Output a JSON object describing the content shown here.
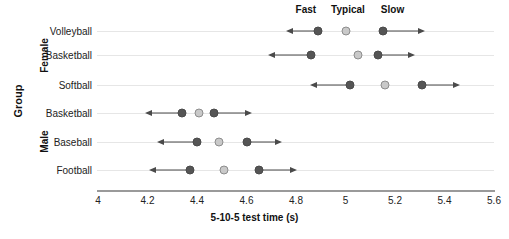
{
  "chart_data": {
    "type": "scatter",
    "title": "",
    "xlabel": "5-10-5 test time (s)",
    "ylabel": "Group",
    "xlim": [
      4,
      5.6
    ],
    "xticks": [
      "4",
      "4.2",
      "4.4",
      "4.6",
      "4.8",
      "5",
      "5.2",
      "5.4",
      "5.6"
    ],
    "xtick_values": [
      4,
      4.2,
      4.4,
      4.6,
      4.8,
      5.0,
      5.2,
      5.4,
      5.6
    ],
    "grid": "horizontal",
    "legend_position": "top",
    "column_headers": [
      "Fast",
      "Typical",
      "Slow"
    ],
    "column_header_x": [
      4.84,
      5.01,
      5.19
    ],
    "group_labels": [
      "Female",
      "Male"
    ],
    "categories": [
      "Volleyball",
      "Basketball",
      "Softball",
      "Basketball",
      "Baseball",
      "Football"
    ],
    "series": [
      {
        "name": "Fast",
        "values": [
          4.89,
          4.86,
          5.02,
          4.34,
          4.4,
          4.37
        ]
      },
      {
        "name": "Typical",
        "values": [
          5.0,
          5.05,
          5.16,
          4.41,
          4.49,
          4.51
        ]
      },
      {
        "name": "Slow",
        "values": [
          5.15,
          5.13,
          5.31,
          4.47,
          4.6,
          4.65
        ]
      }
    ],
    "rows": [
      {
        "group": "Female",
        "label": "Volleyball",
        "fast": 4.89,
        "typical": 5.0,
        "slow": 5.15,
        "fast_arrow_end": 4.77,
        "slow_arrow_end": 5.31
      },
      {
        "group": "Female",
        "label": "Basketball",
        "fast": 4.86,
        "typical": 5.05,
        "slow": 5.13,
        "fast_arrow_end": 4.7,
        "slow_arrow_end": 5.27
      },
      {
        "group": "Female",
        "label": "Softball",
        "fast": 5.02,
        "typical": 5.16,
        "slow": 5.31,
        "fast_arrow_end": 4.87,
        "slow_arrow_end": 5.45
      },
      {
        "group": "Male",
        "label": "Basketball",
        "fast": 4.34,
        "typical": 4.41,
        "slow": 4.47,
        "fast_arrow_end": 4.2,
        "slow_arrow_end": 4.61
      },
      {
        "group": "Male",
        "label": "Baseball",
        "fast": 4.4,
        "typical": 4.49,
        "slow": 4.6,
        "fast_arrow_end": 4.25,
        "slow_arrow_end": 4.73
      },
      {
        "group": "Male",
        "label": "Football",
        "fast": 4.37,
        "typical": 4.51,
        "slow": 4.65,
        "fast_arrow_end": 4.22,
        "slow_arrow_end": 4.79
      }
    ],
    "colors": {
      "fast_dot": "#555555",
      "typical_dot": "#c9c9c9",
      "slow_dot": "#555555",
      "arrow": "#4a4a4a",
      "gridline": "#e6e6e6",
      "axis": "#9a9a9a",
      "text": "#111111"
    }
  }
}
